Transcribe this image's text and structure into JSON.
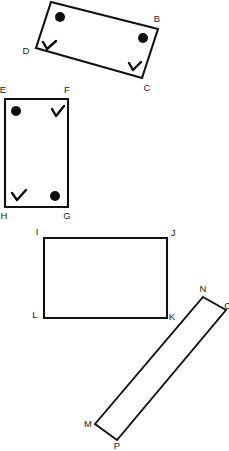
{
  "figure": {
    "background_color": "#ffffff",
    "stroke_color": "#111111",
    "mark_color": "#0d0d0d",
    "label_color": "#1a1a1a",
    "width": 229,
    "height": 451,
    "shapes": [
      {
        "name": "quadrilateral-abcd",
        "kind": "rotated-rectangle",
        "vertices": [
          {
            "label": "A",
            "x": 51,
            "y": 2,
            "label_x": 51,
            "label_y": -6,
            "visible_label": false,
            "mark": "dot"
          },
          {
            "label": "B",
            "x": 158,
            "y": 29,
            "label_x": 157,
            "label_y": 19,
            "visible_label": true,
            "mark": "dot"
          },
          {
            "label": "C",
            "x": 142,
            "y": 78,
            "label_x": 147,
            "label_y": 88,
            "visible_label": true,
            "mark": "check"
          },
          {
            "label": "D",
            "x": 36,
            "y": 48,
            "label_x": 26,
            "label_y": 51,
            "visible_label": true,
            "mark": "check"
          }
        ]
      },
      {
        "name": "quadrilateral-efgh",
        "kind": "rectangle",
        "vertices": [
          {
            "label": "E",
            "x": 5,
            "y": 99,
            "label_x": 3,
            "label_y": 90,
            "visible_label": true,
            "mark": "dot"
          },
          {
            "label": "F",
            "x": 68,
            "y": 99,
            "label_x": 67,
            "label_y": 90,
            "visible_label": true,
            "mark": "check"
          },
          {
            "label": "G",
            "x": 68,
            "y": 207,
            "label_x": 67,
            "label_y": 216,
            "visible_label": true,
            "mark": "dot"
          },
          {
            "label": "H",
            "x": 5,
            "y": 207,
            "label_x": 4,
            "label_y": 216,
            "visible_label": true,
            "mark": "check"
          }
        ]
      },
      {
        "name": "quadrilateral-ijkl",
        "kind": "rectangle",
        "vertices": [
          {
            "label": "I",
            "x": 44,
            "y": 238,
            "label_x": 37,
            "label_y": 232,
            "visible_label": true,
            "mark": "none"
          },
          {
            "label": "J",
            "x": 167,
            "y": 238,
            "label_x": 173,
            "label_y": 233,
            "visible_label": true,
            "mark": "none"
          },
          {
            "label": "K",
            "x": 167,
            "y": 318,
            "label_x": 172,
            "label_y": 317,
            "visible_label": true,
            "mark": "none"
          },
          {
            "label": "L",
            "x": 44,
            "y": 318,
            "label_x": 35,
            "label_y": 315,
            "visible_label": true,
            "mark": "none"
          }
        ]
      },
      {
        "name": "quadrilateral-nomp",
        "kind": "rotated-thin-rectangle",
        "vertices": [
          {
            "label": "N",
            "x": 203,
            "y": 297,
            "label_x": 203,
            "label_y": 289,
            "visible_label": true,
            "mark": "none"
          },
          {
            "label": "O",
            "x": 226,
            "y": 310,
            "label_x": 228,
            "label_y": 306,
            "visible_label": true,
            "mark": "none"
          },
          {
            "label": "P",
            "x": 117,
            "y": 440,
            "label_x": 117,
            "label_y": 446,
            "visible_label": true,
            "mark": "none"
          },
          {
            "label": "M",
            "x": 95,
            "y": 424,
            "label_x": 88,
            "label_y": 424,
            "visible_label": true,
            "mark": "none"
          }
        ]
      }
    ]
  }
}
